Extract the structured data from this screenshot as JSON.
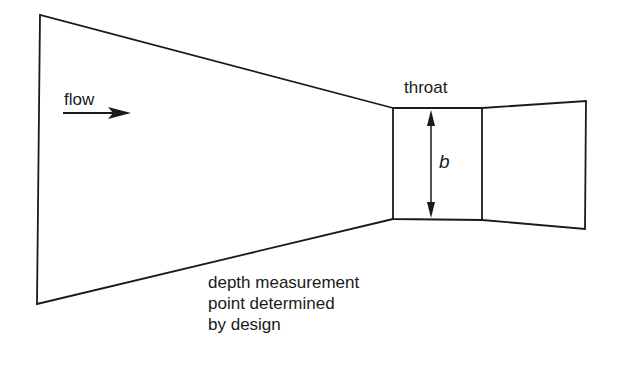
{
  "diagram": {
    "type": "flume-plan-view",
    "labels": {
      "flow": "flow",
      "throat": "throat",
      "throat_width": "b",
      "depth_note_line1": "depth measurement",
      "depth_note_line2": "point determined",
      "depth_note_line3": "by design"
    },
    "colors": {
      "line": "#1a1a1a",
      "background": "#ffffff"
    },
    "shapes": {
      "converging_section": [
        [
          40,
          15
        ],
        [
          393,
          108
        ],
        [
          393,
          219
        ],
        [
          37,
          304
        ]
      ],
      "throat_section": [
        [
          393,
          108
        ],
        [
          482,
          108
        ],
        [
          482,
          220
        ],
        [
          393,
          219
        ]
      ],
      "diverging_section": [
        [
          482,
          108
        ],
        [
          586,
          101
        ],
        [
          585,
          229
        ],
        [
          482,
          220
        ]
      ],
      "flow_arrow": {
        "x1": 63,
        "y1": 113,
        "x2": 131,
        "y2": 113
      },
      "throat_dimension_arrow": {
        "x": 431,
        "y1": 110,
        "y2": 218
      }
    }
  }
}
